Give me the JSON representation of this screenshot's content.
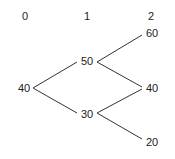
{
  "diagram": {
    "type": "binomial-tree",
    "time_steps": [
      "0",
      "1",
      "2"
    ],
    "nodes": {
      "t0": "40",
      "t1_up": "50",
      "t1_down": "30",
      "t2_uu": "60",
      "t2_ud": "40",
      "t2_dd": "20"
    },
    "edges": [
      [
        "t0",
        "t1_up"
      ],
      [
        "t0",
        "t1_down"
      ],
      [
        "t1_up",
        "t2_uu"
      ],
      [
        "t1_up",
        "t2_ud"
      ],
      [
        "t1_down",
        "t2_ud"
      ],
      [
        "t1_down",
        "t2_dd"
      ]
    ]
  }
}
